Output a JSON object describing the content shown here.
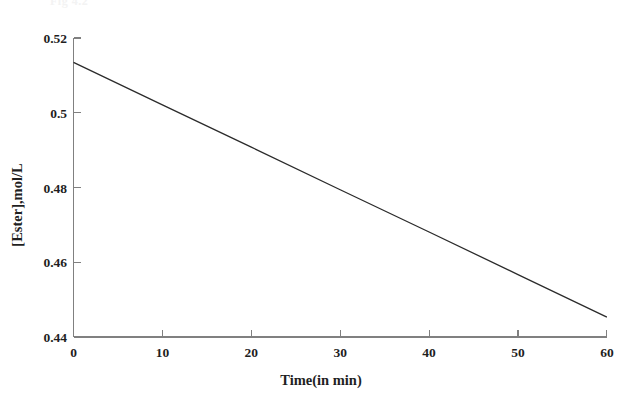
{
  "figure": {
    "ghost_header": "Fig 4.2",
    "background_color": "#ffffff",
    "line_color": "#2b2b2b",
    "axis_color": "#808080",
    "text_color": "#1f1f1f"
  },
  "chart_data": {
    "type": "line",
    "title": "",
    "xlabel": "Time(in min)",
    "ylabel": "[Ester],mol/L",
    "xlim": [
      0,
      60
    ],
    "ylim": [
      0.44,
      0.52
    ],
    "xticks": [
      0,
      10,
      20,
      30,
      40,
      50,
      60
    ],
    "xtick_labels": [
      "0",
      "10",
      "20",
      "30",
      "40",
      "50",
      "60"
    ],
    "yticks": [
      0.44,
      0.46,
      0.48,
      0.5,
      0.52
    ],
    "ytick_labels": [
      "0.44",
      "0.46",
      "0.48",
      "0.5",
      "0.52"
    ],
    "grid": false,
    "legend": false,
    "series": [
      {
        "name": "[Ester]",
        "x": [
          0,
          10,
          20,
          30,
          40,
          50,
          60
        ],
        "values": [
          0.5135,
          0.5021,
          0.4908,
          0.4794,
          0.4681,
          0.4567,
          0.4453
        ]
      }
    ],
    "annotations": []
  }
}
